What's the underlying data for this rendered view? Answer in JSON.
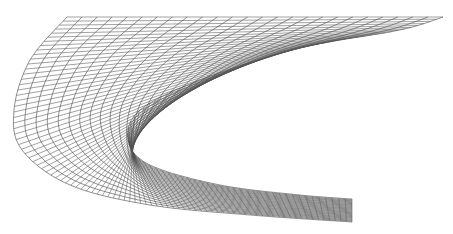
{
  "figure": {
    "type": "structured-grid-mesh",
    "colors": {
      "background": "#ffffff",
      "radial_lines": "#555555",
      "wrap_lines": "#333333"
    },
    "grid": {
      "wrap_lines": 26,
      "radial_lines": 90
    },
    "outer_boundary": [
      [
        67,
        17
      ],
      [
        30,
        60
      ],
      [
        14,
        110
      ],
      [
        22,
        150
      ],
      [
        70,
        185
      ],
      [
        150,
        205
      ],
      [
        250,
        215
      ],
      [
        352,
        222
      ]
    ],
    "inner_boundary": [
      [
        443,
        17
      ],
      [
        400,
        30
      ],
      [
        300,
        48
      ],
      [
        200,
        80
      ],
      [
        140,
        110
      ],
      [
        128,
        140
      ],
      [
        150,
        165
      ],
      [
        220,
        185
      ],
      [
        300,
        195
      ],
      [
        352,
        199
      ]
    ]
  }
}
